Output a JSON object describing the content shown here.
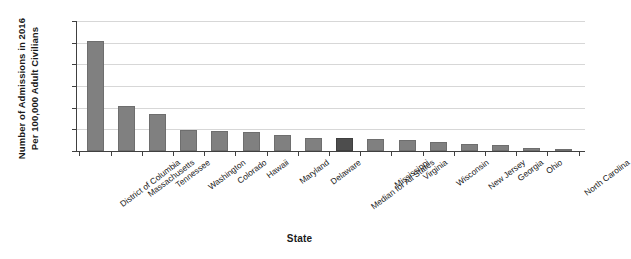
{
  "chart_data": {
    "type": "bar",
    "title": "",
    "xlabel": "State",
    "ylabel": "Number of Admissions in 2016 Per 100,000 Adult Civilians",
    "ylabel_lines": [
      "Number of Admissions in 2016",
      "Per 100,000 Adult Civilians"
    ],
    "categories": [
      "District of Columbia",
      "Massachusetts",
      "Tennessee",
      "Washington",
      "Colorado",
      "Hawaii",
      "Maryland",
      "Delaware",
      "Median for All States",
      "Mississippi",
      "Virginia",
      "Wisconsin",
      "New Jersey",
      "Georgia",
      "Ohio",
      "North Carolina"
    ],
    "values": [
      25.3,
      10.5,
      8.6,
      4.8,
      4.6,
      4.3,
      3.7,
      2.9,
      2.9,
      2.8,
      2.5,
      2.1,
      1.7,
      1.3,
      0.7,
      0.5
    ],
    "ylim": [
      0,
      30
    ],
    "ytick_labels": [
      "30",
      "25",
      "20",
      "15",
      "10",
      "5",
      "0"
    ],
    "ytick_values": [
      30,
      25,
      20,
      15,
      10,
      5,
      0
    ],
    "grid": "horizontal",
    "legend": "none",
    "highlight_index": 8,
    "bar_color": "#808080",
    "highlight_color": "#4d4d4d",
    "grid_color": "#d7d7d7",
    "axis_color": "#404040"
  }
}
